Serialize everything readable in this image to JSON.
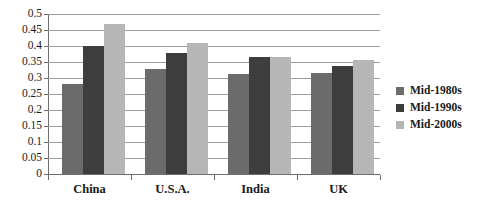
{
  "chart_data": {
    "type": "bar",
    "title": "",
    "subtitle": "",
    "xlabel": "",
    "ylabel": "",
    "categories": [
      "China",
      "U.S.A.",
      "India",
      "UK"
    ],
    "series": [
      {
        "name": "Mid-1980s",
        "color": "#6b6b6b",
        "values": [
          0.28,
          0.328,
          0.313,
          0.317
        ]
      },
      {
        "name": "Mid-1990s",
        "color": "#3d3d3d",
        "values": [
          0.4,
          0.378,
          0.367,
          0.337
        ]
      },
      {
        "name": "Mid-2000s",
        "color": "#b6b6b6",
        "values": [
          0.468,
          0.408,
          0.367,
          0.355
        ]
      }
    ],
    "ylim": [
      0,
      0.5
    ],
    "ytick_step": 0.05,
    "ytick_labels": [
      "0.5",
      "0.45",
      "0.4",
      "0.35",
      "0.3",
      "0.25",
      "0.2",
      "0.15",
      "0.1",
      "0.05",
      "0"
    ],
    "ytick_values": [
      0.5,
      0.45,
      0.4,
      0.35,
      0.3,
      0.25,
      0.2,
      0.15,
      0.1,
      0.05,
      0
    ],
    "grid": true,
    "grid_axis": "y",
    "legend_position": "right",
    "background": "#ffffff",
    "axis_color": "#6e6e6e",
    "grid_color": "#9c9c9c"
  }
}
